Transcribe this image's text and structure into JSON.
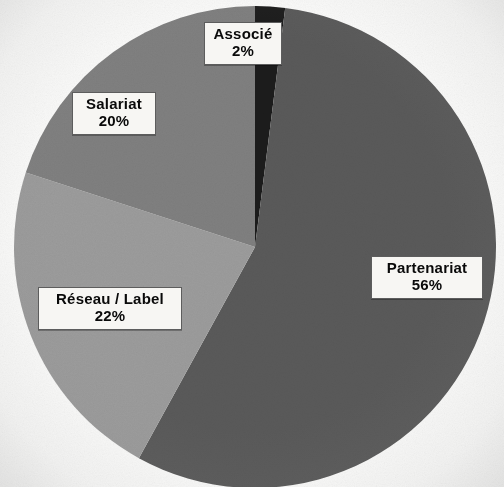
{
  "chart_data": {
    "type": "pie",
    "title": "",
    "subtitle": "",
    "legend_position": "none",
    "labels_inside": true,
    "start_angle_deg": 0,
    "direction": "clockwise",
    "categories": [
      "Associé",
      "Partenariat",
      "Réseau / Label",
      "Salariat"
    ],
    "values": [
      2,
      56,
      22,
      20
    ],
    "value_unit": "%",
    "total": 100,
    "colors": [
      "#1a1a1a",
      "#5a5a5a",
      "#9c9c9c",
      "#808080"
    ],
    "slices": [
      {
        "name": "Associé",
        "value": 2,
        "value_label": "2%",
        "color": "#1a1a1a",
        "start_deg": 0,
        "end_deg": 7.2
      },
      {
        "name": "Partenariat",
        "value": 56,
        "value_label": "56%",
        "color": "#5a5a5a",
        "start_deg": 7.2,
        "end_deg": 208.8
      },
      {
        "name": "Réseau / Label",
        "value": 22,
        "value_label": "22%",
        "color": "#9c9c9c",
        "start_deg": 208.8,
        "end_deg": 288.0
      },
      {
        "name": "Salariat",
        "value": 20,
        "value_label": "20%",
        "color": "#808080",
        "start_deg": 288.0,
        "end_deg": 360.0
      }
    ],
    "geometry": {
      "center_x": 255,
      "center_y": 247,
      "radius": 241,
      "cropped_bottom": true
    },
    "background_color": "#fdfdfc",
    "label_box": {
      "background": "#f7f6f3",
      "border_color": "#5d5d5d",
      "text_color": "#0a0a0a"
    }
  }
}
